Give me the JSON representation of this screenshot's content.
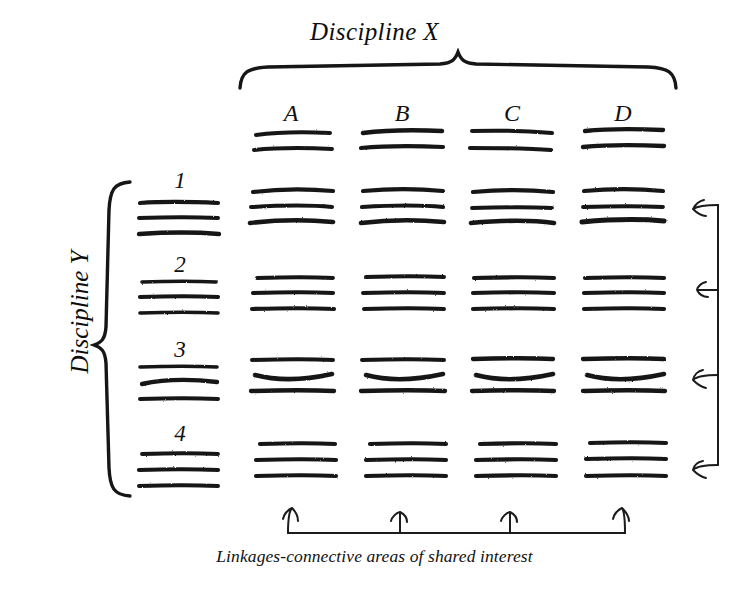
{
  "figure": {
    "kind": "matrix-diagram",
    "x_axis_title": "Discipline X",
    "y_axis_title": "Discipline Y",
    "caption": "Linkages-connective areas of shared interest",
    "ink_color": "#111111",
    "background_color": "#ffffff"
  },
  "columns": [
    {
      "label": "A",
      "scribble_lines": 2
    },
    {
      "label": "B",
      "scribble_lines": 2
    },
    {
      "label": "C",
      "scribble_lines": 2
    },
    {
      "label": "D",
      "scribble_lines": 2
    }
  ],
  "rows": [
    {
      "label": "1",
      "scribble_lines": 3
    },
    {
      "label": "2",
      "scribble_lines": 3
    },
    {
      "label": "3",
      "scribble_lines": 3
    },
    {
      "label": "4",
      "scribble_lines": 3
    }
  ],
  "cells": [
    {
      "row": "1",
      "column": "A",
      "scribble_lines": 3
    },
    {
      "row": "1",
      "column": "B",
      "scribble_lines": 3
    },
    {
      "row": "1",
      "column": "C",
      "scribble_lines": 3
    },
    {
      "row": "1",
      "column": "D",
      "scribble_lines": 3
    },
    {
      "row": "2",
      "column": "A",
      "scribble_lines": 3
    },
    {
      "row": "2",
      "column": "B",
      "scribble_lines": 3
    },
    {
      "row": "2",
      "column": "C",
      "scribble_lines": 3
    },
    {
      "row": "2",
      "column": "D",
      "scribble_lines": 3
    },
    {
      "row": "3",
      "column": "A",
      "scribble_lines": 3
    },
    {
      "row": "3",
      "column": "B",
      "scribble_lines": 3
    },
    {
      "row": "3",
      "column": "C",
      "scribble_lines": 3
    },
    {
      "row": "3",
      "column": "D",
      "scribble_lines": 3
    },
    {
      "row": "4",
      "column": "A",
      "scribble_lines": 3
    },
    {
      "row": "4",
      "column": "B",
      "scribble_lines": 3
    },
    {
      "row": "4",
      "column": "C",
      "scribble_lines": 3
    },
    {
      "row": "4",
      "column": "D",
      "scribble_lines": 3
    }
  ],
  "annotations": {
    "top_brace": "brace spanning columns A through D under the Discipline X title",
    "left_brace": "brace spanning rows 1 through 4 beside the Discipline Y title",
    "bottom_arrows": {
      "count": 4,
      "direction": "up",
      "points_to": [
        "A",
        "B",
        "C",
        "D"
      ]
    },
    "right_arrows": {
      "count": 4,
      "direction": "left",
      "points_to": [
        "1",
        "2",
        "3",
        "4"
      ]
    }
  }
}
